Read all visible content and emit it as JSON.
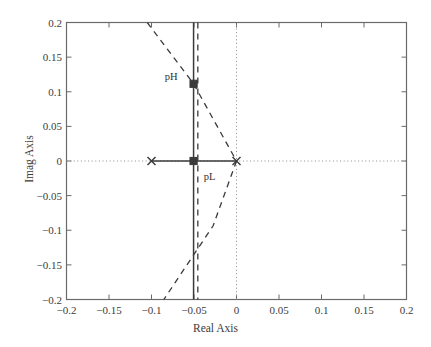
{
  "chart_data": {
    "type": "scatter",
    "title": "",
    "xlabel": "Real Axis",
    "ylabel": "Imag Axis",
    "xlim": [
      -0.2,
      0.2
    ],
    "ylim": [
      -0.2,
      0.2
    ],
    "xticks": [
      -0.2,
      -0.15,
      -0.1,
      -0.05,
      0,
      0.05,
      0.1,
      0.15,
      0.2
    ],
    "xtick_labels": [
      "−0.2",
      "−0.15",
      "−0.1",
      "−0.05",
      "0",
      "0.05",
      "0.1",
      "0.15",
      "0.2"
    ],
    "yticks": [
      -0.2,
      -0.15,
      -0.1,
      -0.05,
      0,
      0.05,
      0.1,
      0.15,
      0.2
    ],
    "ytick_labels": [
      "−0.2",
      "−0.15",
      "−0.1",
      "−0.05",
      "0",
      "0.05",
      "0.1",
      "0.15",
      "0.2"
    ],
    "grid": false,
    "legend": false,
    "series": [
      {
        "name": "open-loop-poles",
        "style": "x-marker",
        "points": [
          {
            "x": -0.1,
            "y": 0.0
          },
          {
            "x": 0.0,
            "y": 0.0
          }
        ]
      },
      {
        "name": "closed-loop-design-points",
        "style": "square-marker",
        "points": [
          {
            "x": -0.0505,
            "y": 0.1115,
            "label": "pH"
          },
          {
            "x": -0.0505,
            "y": 0.0,
            "label": "pL"
          }
        ]
      },
      {
        "name": "real-axis-locus-branch",
        "style": "solid",
        "points": [
          {
            "x": -0.1,
            "y": 0.0
          },
          {
            "x": 0.0,
            "y": 0.0
          }
        ]
      },
      {
        "name": "vertical-locus-branch",
        "style": "solid",
        "points": [
          {
            "x": -0.0505,
            "y": -0.2
          },
          {
            "x": -0.0505,
            "y": 0.2
          }
        ]
      },
      {
        "name": "constant-damping-dashed-line",
        "style": "dashed",
        "points": [
          {
            "x": -0.105,
            "y": 0.2
          },
          {
            "x": -0.0505,
            "y": 0.1115
          },
          {
            "x": 0.0,
            "y": 0.0
          },
          {
            "x": -0.0275,
            "y": -0.0935
          },
          {
            "x": -0.0855,
            "y": -0.2
          }
        ]
      },
      {
        "name": "asymptote-dashed-vertical",
        "style": "dashed",
        "points": [
          {
            "x": -0.0455,
            "y": 0.2
          },
          {
            "x": -0.0455,
            "y": -0.2
          }
        ]
      },
      {
        "name": "imag-axis-dotted",
        "style": "dotted",
        "points": [
          {
            "x": 0.0,
            "y": -0.2
          },
          {
            "x": 0.0,
            "y": 0.2
          }
        ]
      },
      {
        "name": "real-axis-dotted",
        "style": "dotted",
        "points": [
          {
            "x": -0.2,
            "y": 0.0
          },
          {
            "x": 0.2,
            "y": 0.0
          }
        ]
      }
    ],
    "annotations": [
      {
        "text": "pH",
        "x": -0.0845,
        "y": 0.1205
      },
      {
        "text": "pL",
        "x": -0.0385,
        "y": -0.0245
      }
    ]
  },
  "colors": {
    "axis": "#6b6b6b",
    "line": "#3a3a3a",
    "dotted": "#8c8c8c",
    "text": "#3c3c3c",
    "background": "#ffffff"
  }
}
